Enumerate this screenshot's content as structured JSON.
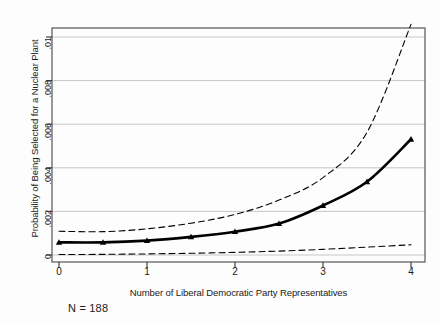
{
  "chart_data": {
    "type": "line",
    "title": "",
    "xlabel": "Number of Liberal Democratic Party Representatives",
    "ylabel": "Probability of Being Selected for a Nuclear Plant",
    "annotation": "N = 188",
    "xlim": [
      0,
      4
    ],
    "ylim": [
      0,
      0.0108
    ],
    "grid": "horizontal",
    "legend": "none",
    "xticks": [
      0,
      1,
      2,
      3,
      4
    ],
    "xtick_labels": [
      "0",
      "1",
      "2",
      "3",
      "4"
    ],
    "yticks": [
      0,
      0.002,
      0.004,
      0.006,
      0.008,
      0.01
    ],
    "ytick_labels": [
      "0",
      ".002",
      ".004",
      ".006",
      ".008",
      ".01"
    ],
    "x": [
      0,
      0.5,
      1,
      1.5,
      2,
      2.5,
      3,
      3.5,
      4
    ],
    "series": [
      {
        "name": "Predicted probability",
        "style": "solid-with-triangle-markers",
        "color": "#000000",
        "values": [
          0.00058,
          0.00058,
          0.00066,
          0.00083,
          0.00107,
          0.00144,
          0.00227,
          0.00336,
          0.00531
        ]
      },
      {
        "name": "Upper confidence bound",
        "style": "dashed",
        "color": "#000000",
        "values": [
          0.00109,
          0.00107,
          0.0012,
          0.00146,
          0.00186,
          0.00252,
          0.00355,
          0.00563,
          0.01058
        ]
      },
      {
        "name": "Lower confidence bound",
        "style": "dashed",
        "color": "#000000",
        "values": [
          2e-05,
          3e-05,
          5e-05,
          8e-05,
          0.00012,
          0.00018,
          0.00026,
          0.00036,
          0.00047
        ]
      }
    ]
  },
  "axis_labels": {
    "y": "Probability of Being Selected for a Nuclear Plant",
    "x": "Number of Liberal Democratic Party Representatives",
    "note": "N = 188"
  },
  "ytick_text": {
    "t0": "0",
    "t1": ".002",
    "t2": ".004",
    "t3": ".006",
    "t4": ".008",
    "t5": ".01"
  },
  "xtick_text": {
    "t0": "0",
    "t1": "1",
    "t2": "2",
    "t3": "3",
    "t4": "4"
  },
  "colors": {
    "line": "#000000",
    "frame": "#555555",
    "grid": "#b8b8b8",
    "background": "#fdfdfd"
  }
}
